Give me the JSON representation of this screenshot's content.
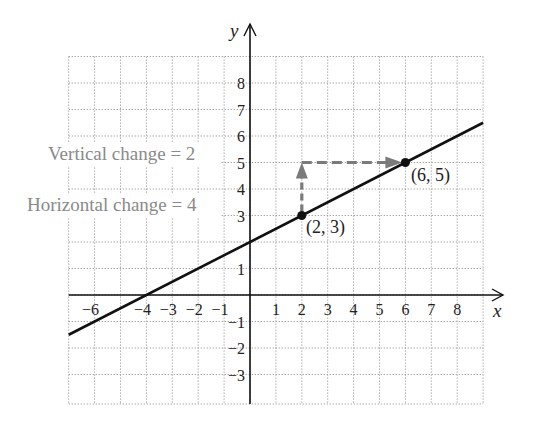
{
  "chart_data": {
    "type": "line",
    "title": "",
    "xlabel": "x",
    "ylabel": "y",
    "xlim": [
      -7,
      9
    ],
    "ylim": [
      -4,
      9
    ],
    "grid": true,
    "x_ticks": [
      -6,
      -4,
      -3,
      -2,
      -1,
      1,
      2,
      3,
      4,
      5,
      6,
      7,
      8
    ],
    "x_tick_labels": [
      "−6",
      "−4",
      "−3",
      "−2",
      "−1",
      "1",
      "2",
      "3",
      "4",
      "5",
      "6",
      "7",
      "8"
    ],
    "y_ticks": [
      8,
      7,
      6,
      5,
      4,
      3,
      1,
      -1,
      -2,
      -3
    ],
    "y_tick_labels": [
      "8",
      "7",
      "6",
      "5",
      "4",
      "3",
      "1",
      "−1",
      "−2",
      "−3"
    ],
    "series": [
      {
        "name": "line",
        "equation": "y = 0.5x + 2",
        "x": [
          -7,
          9
        ],
        "y": [
          -1.5,
          6.5
        ],
        "color": "#111111"
      }
    ],
    "points": [
      {
        "x": 2,
        "y": 3,
        "label": "(2, 3)"
      },
      {
        "x": 6,
        "y": 5,
        "label": "(6, 5)"
      }
    ],
    "annotations": [
      {
        "text": "Vertical change = 2",
        "type": "dashed-arrow",
        "from": [
          2,
          3
        ],
        "to": [
          2,
          5
        ],
        "color": "#7a7a7a"
      },
      {
        "text": "Horizontal change = 4",
        "type": "dashed-arrow",
        "from": [
          2,
          5
        ],
        "to": [
          6,
          5
        ],
        "color": "#7a7a7a"
      }
    ]
  },
  "labels": {
    "x_axis": "x",
    "y_axis": "y",
    "vertical_change": "Vertical change = 2",
    "horizontal_change": "Horizontal change = 4",
    "point_a": "(2, 3)",
    "point_b": "(6, 5)"
  },
  "colors": {
    "grid": "#9a9a9a",
    "axis": "#111111",
    "line": "#111111",
    "arrow": "#7a7a7a",
    "annotation_text": "#8a8a8a"
  }
}
